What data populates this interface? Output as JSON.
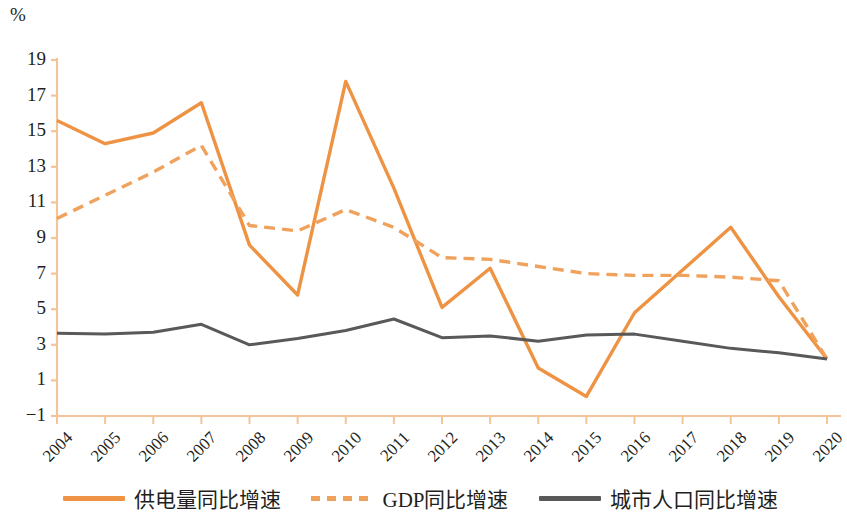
{
  "chart_data": {
    "type": "line",
    "title": "",
    "xlabel": "",
    "ylabel": "%",
    "unit_label": "%",
    "ylim": [
      -1,
      19
    ],
    "ytick_labels": [
      "19",
      "17",
      "15",
      "13",
      "11",
      "9",
      "7",
      "5",
      "3",
      "1",
      "−1"
    ],
    "yticks": [
      19,
      17,
      15,
      13,
      11,
      9,
      7,
      5,
      3,
      1,
      -1
    ],
    "grid": false,
    "legend_position": "bottom",
    "categories": [
      "2004",
      "2005",
      "2006",
      "2007",
      "2008",
      "2009",
      "2010",
      "2011",
      "2012",
      "2013",
      "2014",
      "2015",
      "2016",
      "2017",
      "2018",
      "2019",
      "2020"
    ],
    "x": [
      2004,
      2005,
      2006,
      2007,
      2008,
      2009,
      2010,
      2011,
      2012,
      2013,
      2014,
      2015,
      2016,
      2017,
      2018,
      2019,
      2020
    ],
    "series": [
      {
        "name": "供电量同比增速",
        "style": "solid",
        "color": "#ED9343",
        "width": 3.4,
        "values": [
          15.6,
          14.3,
          14.9,
          16.6,
          8.6,
          5.8,
          17.8,
          11.8,
          5.1,
          7.3,
          1.7,
          0.1,
          4.8,
          7.2,
          9.6,
          5.7,
          2.2
        ]
      },
      {
        "name": "GDP同比增速",
        "style": "dashed",
        "color": "#F0A25C",
        "width": 3.4,
        "values": [
          10.1,
          11.4,
          12.7,
          14.2,
          9.7,
          9.4,
          10.6,
          9.6,
          7.9,
          7.8,
          7.4,
          7.0,
          6.9,
          6.9,
          6.8,
          6.6,
          2.2
        ]
      },
      {
        "name": "城市人口同比增速",
        "style": "solid",
        "color": "#595959",
        "width": 3.0,
        "values": [
          3.65,
          3.6,
          3.7,
          4.15,
          3.0,
          3.35,
          3.8,
          4.45,
          3.4,
          3.5,
          3.2,
          3.55,
          3.6,
          3.2,
          2.8,
          2.55,
          2.2
        ]
      }
    ]
  },
  "legend": {
    "items": [
      {
        "label": "供电量同比增速",
        "style": "solid-orange"
      },
      {
        "label": "GDP同比增速",
        "style": "dashed-orange"
      },
      {
        "label": "城市人口同比增速",
        "style": "solid-gray"
      }
    ]
  },
  "colors": {
    "accent_orange": "#ED9343",
    "dashed_orange": "#F0A25C",
    "gray": "#595959",
    "axis": "#F3C39A",
    "text": "#231f20"
  }
}
